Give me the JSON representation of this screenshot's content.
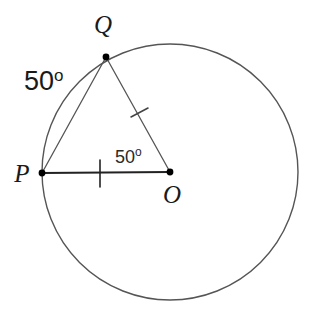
{
  "diagram": {
    "background_color": "#ffffff",
    "stroke_color": "#555555",
    "bold_stroke_color": "#222222",
    "point_color": "#000000",
    "circle": {
      "name": "circle-o",
      "center_x": 170,
      "center_y": 172,
      "radius": 128,
      "stroke_width": 1.4
    },
    "points": [
      {
        "name": "point-p",
        "label": "P",
        "cx": 42,
        "cy": 173,
        "label_x": 22,
        "label_y": 182,
        "radius": 3.4
      },
      {
        "name": "point-q",
        "label": "Q",
        "cx": 106,
        "cy": 57,
        "label_x": 103,
        "label_y": 33,
        "radius": 3.4
      },
      {
        "name": "point-o",
        "label": "O",
        "cx": 170,
        "cy": 172,
        "label_x": 172,
        "label_y": 203,
        "radius": 3.4
      }
    ],
    "segments": [
      {
        "name": "segment-pq",
        "x1": 42,
        "y1": 173,
        "x2": 106,
        "y2": 57,
        "stroke_width": 1.3,
        "emphasis": "thin"
      },
      {
        "name": "segment-qo",
        "x1": 106,
        "y1": 57,
        "x2": 170,
        "y2": 172,
        "stroke_width": 1.3,
        "emphasis": "thin"
      },
      {
        "name": "segment-po",
        "x1": 42,
        "y1": 173,
        "x2": 170,
        "y2": 172,
        "stroke_width": 2.2,
        "emphasis": "bold"
      }
    ],
    "tick_marks": [
      {
        "name": "tick-mark-po",
        "x1": 100,
        "y1": 160,
        "x2": 100,
        "y2": 187,
        "stroke_width": 1.6
      },
      {
        "name": "tick-mark-qo",
        "x1": 131,
        "y1": 117,
        "x2": 148,
        "y2": 108,
        "stroke_width": 1.6
      }
    ],
    "angle_labels": [
      {
        "name": "angle-label-arc-pq",
        "value": "50",
        "degree": "o",
        "x": 24,
        "y": 90,
        "size": "large"
      },
      {
        "name": "angle-label-qop",
        "value": "50",
        "degree": "o",
        "x": 115,
        "y": 163,
        "size": "small"
      }
    ]
  }
}
